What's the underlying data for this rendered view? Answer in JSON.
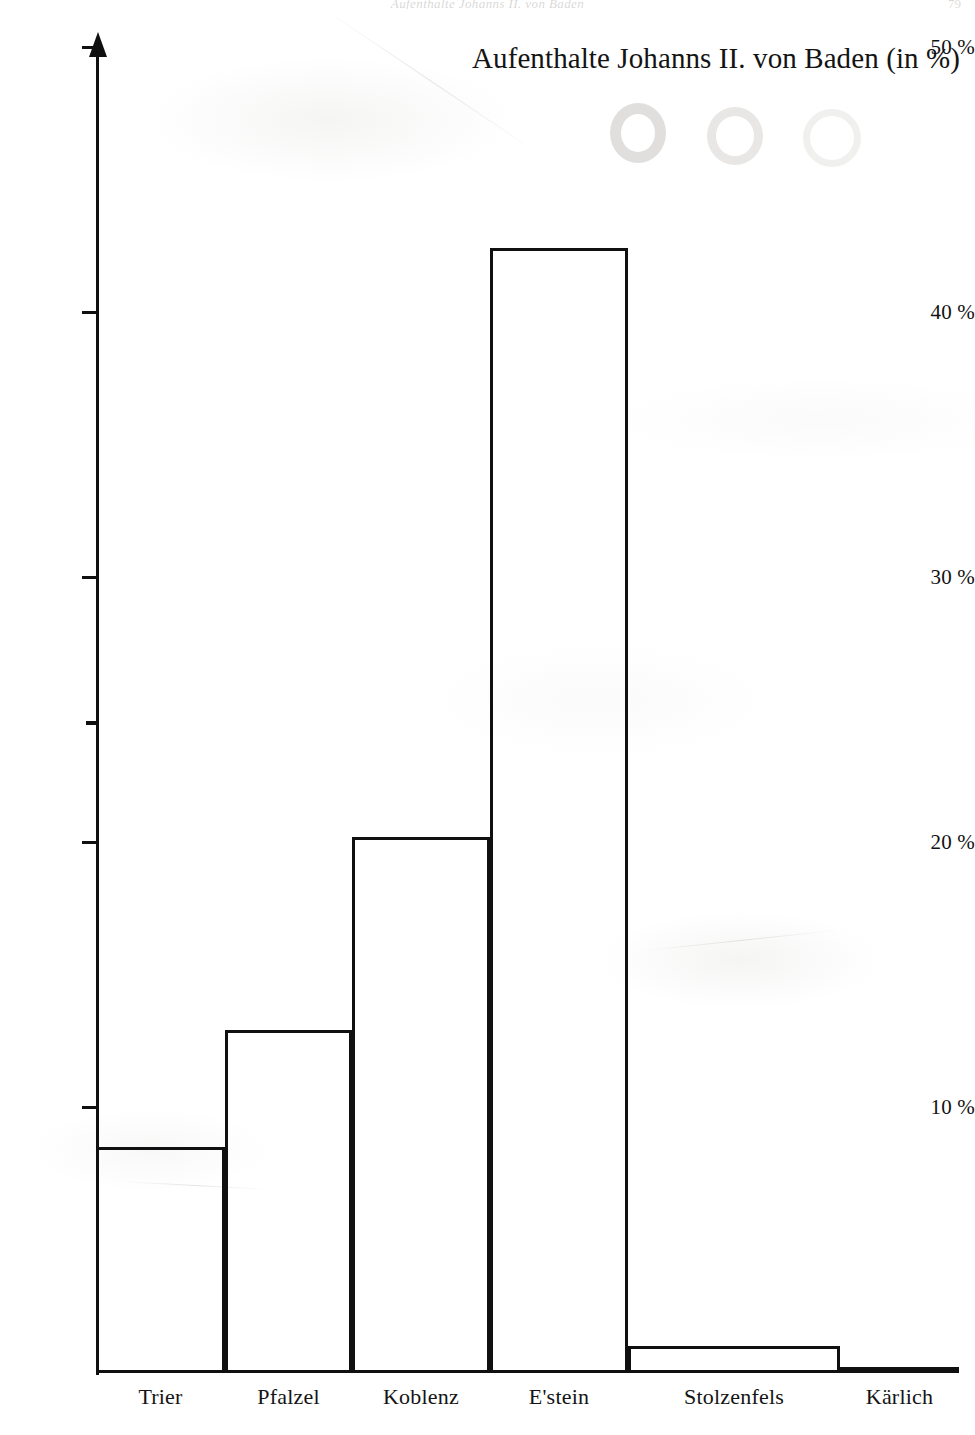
{
  "page": {
    "running_header": "Aufenthalte Johanns II. von Baden",
    "folio": "79"
  },
  "chart_data": {
    "type": "bar",
    "title": "Aufenthalte Johanns II. von Baden (in %)",
    "xlabel": "",
    "ylabel": "",
    "ylim": [
      0,
      50
    ],
    "grid": false,
    "legend": false,
    "orientation": "vertical",
    "bar_style": "hollow outlined rectangles, adjacent (no gaps)",
    "categories": [
      "Trier",
      "Pfalzel",
      "Koblenz",
      "E'stein",
      "Stolzenfels",
      "Kärlich"
    ],
    "values": [
      8.5,
      12.9,
      20.2,
      42.4,
      1.0,
      0.1
    ],
    "value_unit": "%",
    "y_ticks": [
      {
        "label": "50 %",
        "value": 50
      },
      {
        "label": "40 %",
        "value": 40
      },
      {
        "label": "30 %",
        "value": 30
      },
      {
        "label": "20 %",
        "value": 20
      },
      {
        "label": "10 %",
        "value": 10
      }
    ],
    "y_minor_ticks": [
      24.5
    ],
    "axis_arrow": "up",
    "accent_color": "#101010",
    "background_color": "#ffffff"
  }
}
